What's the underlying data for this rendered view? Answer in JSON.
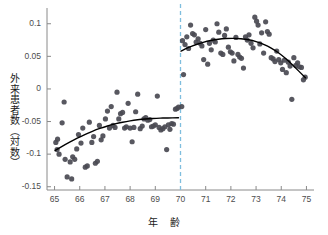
{
  "chart_data": {
    "type": "scatter",
    "title": "",
    "xlabel": "年　齢",
    "ylabel": "外来患者数（対数）",
    "xlim": [
      64.7,
      75.3
    ],
    "ylim": [
      -0.155,
      0.118
    ],
    "xticks": [
      65,
      66,
      67,
      68,
      69,
      70,
      71,
      72,
      73,
      74,
      75
    ],
    "yticks": [
      0.1,
      0.05,
      0,
      -0.05,
      -0.1,
      -0.15
    ],
    "ytick_labels": [
      "0.1",
      "0.05",
      "0",
      "-0.05",
      "-0.1",
      "-0.15"
    ],
    "xtick_labels": [
      "65",
      "66",
      "67",
      "68",
      "69",
      "70",
      "71",
      "72",
      "73",
      "74",
      "75"
    ],
    "grid": false,
    "legend": "none",
    "marker_color": "#4a4a52",
    "curve_color": "#000000",
    "cutoff_line": {
      "x": 70,
      "color": "#7fbede",
      "style": "dashed",
      "label": ""
    },
    "series": [
      {
        "name": "left-scatter",
        "points": [
          [
            65.05,
            -0.082
          ],
          [
            65.1,
            -0.093
          ],
          [
            65.12,
            -0.077
          ],
          [
            65.18,
            -0.1
          ],
          [
            65.3,
            -0.052
          ],
          [
            65.38,
            -0.02
          ],
          [
            65.42,
            -0.108
          ],
          [
            65.5,
            -0.135
          ],
          [
            65.62,
            -0.112
          ],
          [
            65.68,
            -0.138
          ],
          [
            65.72,
            -0.104
          ],
          [
            65.8,
            -0.108
          ],
          [
            65.88,
            -0.092
          ],
          [
            65.95,
            -0.07
          ],
          [
            66.05,
            -0.083
          ],
          [
            66.12,
            -0.06
          ],
          [
            66.22,
            -0.12
          ],
          [
            66.3,
            -0.118
          ],
          [
            66.38,
            -0.051
          ],
          [
            66.48,
            -0.082
          ],
          [
            66.55,
            -0.073
          ],
          [
            66.62,
            -0.114
          ],
          [
            66.7,
            -0.111
          ],
          [
            66.78,
            -0.056
          ],
          [
            66.85,
            -0.078
          ],
          [
            66.92,
            -0.072
          ],
          [
            67.02,
            -0.046
          ],
          [
            67.1,
            -0.034
          ],
          [
            67.18,
            -0.06
          ],
          [
            67.25,
            -0.027
          ],
          [
            67.32,
            -0.056
          ],
          [
            67.4,
            -0.059
          ],
          [
            67.48,
            -0.005
          ],
          [
            67.55,
            -0.046
          ],
          [
            67.62,
            -0.038
          ],
          [
            67.7,
            -0.036
          ],
          [
            67.78,
            -0.06
          ],
          [
            67.85,
            -0.058
          ],
          [
            67.92,
            -0.022
          ],
          [
            68.0,
            -0.06
          ],
          [
            68.08,
            -0.081
          ],
          [
            68.15,
            -0.059
          ],
          [
            68.22,
            -0.035
          ],
          [
            68.3,
            -0.008
          ],
          [
            68.4,
            -0.061
          ],
          [
            68.48,
            -0.057
          ],
          [
            68.55,
            -0.046
          ],
          [
            68.62,
            -0.044
          ],
          [
            68.7,
            -0.048
          ],
          [
            68.78,
            -0.047
          ],
          [
            68.85,
            -0.058
          ],
          [
            68.92,
            -0.057
          ],
          [
            69.0,
            -0.055
          ],
          [
            69.08,
            -0.011
          ],
          [
            69.15,
            -0.059
          ],
          [
            69.22,
            -0.063
          ],
          [
            69.3,
            -0.061
          ],
          [
            69.38,
            -0.058
          ],
          [
            69.45,
            -0.093
          ],
          [
            69.52,
            -0.055
          ],
          [
            69.58,
            -0.062
          ],
          [
            69.65,
            -0.053
          ],
          [
            69.72,
            -0.054
          ],
          [
            69.8,
            -0.031
          ],
          [
            69.86,
            -0.03
          ],
          [
            69.92,
            -0.028
          ]
        ]
      },
      {
        "name": "right-scatter",
        "points": [
          [
            70.05,
            -0.027
          ],
          [
            70.08,
            0.074
          ],
          [
            70.12,
            0.022
          ],
          [
            70.18,
            0.068
          ],
          [
            70.25,
            0.08
          ],
          [
            70.32,
            0.062
          ],
          [
            70.4,
            0.098
          ],
          [
            70.48,
            0.085
          ],
          [
            70.55,
            0.083
          ],
          [
            70.62,
            0.072
          ],
          [
            70.7,
            0.077
          ],
          [
            70.78,
            0.07
          ],
          [
            70.85,
            0.066
          ],
          [
            70.92,
            0.045
          ],
          [
            71.0,
            0.091
          ],
          [
            71.08,
            0.038
          ],
          [
            71.15,
            0.07
          ],
          [
            71.22,
            0.06
          ],
          [
            71.3,
            0.075
          ],
          [
            71.38,
            0.072
          ],
          [
            71.45,
            0.1
          ],
          [
            71.52,
            0.087
          ],
          [
            71.6,
            0.055
          ],
          [
            71.68,
            0.053
          ],
          [
            71.75,
            0.082
          ],
          [
            71.82,
            0.092
          ],
          [
            71.9,
            0.064
          ],
          [
            71.98,
            0.057
          ],
          [
            72.05,
            0.055
          ],
          [
            72.12,
            0.043
          ],
          [
            72.2,
            0.079
          ],
          [
            72.28,
            0.053
          ],
          [
            72.35,
            0.049
          ],
          [
            72.42,
            0.047
          ],
          [
            72.5,
            0.032
          ],
          [
            72.58,
            0.08
          ],
          [
            72.65,
            0.075
          ],
          [
            72.72,
            0.083
          ],
          [
            72.8,
            0.07
          ],
          [
            72.88,
            0.063
          ],
          [
            72.95,
            0.11
          ],
          [
            73.02,
            0.104
          ],
          [
            73.08,
            0.098
          ],
          [
            73.15,
            0.069
          ],
          [
            73.22,
            0.086
          ],
          [
            73.3,
            0.055
          ],
          [
            73.38,
            0.103
          ],
          [
            73.45,
            0.088
          ],
          [
            73.52,
            0.084
          ],
          [
            73.6,
            0.048
          ],
          [
            73.68,
            0.046
          ],
          [
            73.75,
            0.042
          ],
          [
            73.82,
            0.058
          ],
          [
            73.9,
            0.045
          ],
          [
            73.98,
            0.04
          ],
          [
            74.05,
            0.03
          ],
          [
            74.12,
            0.044
          ],
          [
            74.2,
            0.025
          ],
          [
            74.28,
            0.041
          ],
          [
            74.35,
            0.035
          ],
          [
            74.42,
            -0.016
          ],
          [
            74.5,
            0.048
          ],
          [
            74.58,
            0.036
          ],
          [
            74.65,
            0.04
          ],
          [
            74.72,
            0.034
          ],
          [
            74.8,
            0.033
          ],
          [
            74.88,
            0.014
          ],
          [
            74.95,
            0.018
          ]
        ]
      }
    ],
    "fits": [
      {
        "name": "left-fit",
        "x_start": 65.02,
        "x_end": 69.92,
        "points": [
          [
            65.02,
            -0.0945
          ],
          [
            65.3,
            -0.088
          ],
          [
            65.6,
            -0.0815
          ],
          [
            65.9,
            -0.0755
          ],
          [
            66.2,
            -0.07
          ],
          [
            66.5,
            -0.065
          ],
          [
            66.8,
            -0.0606
          ],
          [
            67.1,
            -0.0568
          ],
          [
            67.4,
            -0.0536
          ],
          [
            67.7,
            -0.051
          ],
          [
            68.0,
            -0.0489
          ],
          [
            68.3,
            -0.0473
          ],
          [
            68.6,
            -0.0461
          ],
          [
            68.9,
            -0.0453
          ],
          [
            69.2,
            -0.0448
          ],
          [
            69.5,
            -0.0445
          ],
          [
            69.92,
            -0.0442
          ]
        ]
      },
      {
        "name": "right-fit",
        "x_start": 70.02,
        "x_end": 74.96,
        "points": [
          [
            70.02,
            0.058
          ],
          [
            70.3,
            0.0632
          ],
          [
            70.6,
            0.0678
          ],
          [
            70.9,
            0.0714
          ],
          [
            71.2,
            0.0742
          ],
          [
            71.5,
            0.0762
          ],
          [
            71.8,
            0.0773
          ],
          [
            72.1,
            0.0776
          ],
          [
            72.4,
            0.077
          ],
          [
            72.7,
            0.0754
          ],
          [
            73.0,
            0.0726
          ],
          [
            73.3,
            0.0684
          ],
          [
            73.6,
            0.0627
          ],
          [
            73.9,
            0.0552
          ],
          [
            74.2,
            0.0459
          ],
          [
            74.5,
            0.0348
          ],
          [
            74.96,
            0.0172
          ]
        ]
      }
    ],
    "discontinuity": {
      "left_limit": -0.044,
      "right_limit": 0.058,
      "jump": 0.102
    }
  },
  "axes": {
    "spine_color": "#8a8a8a",
    "tick_color": "#8a8a8a"
  }
}
